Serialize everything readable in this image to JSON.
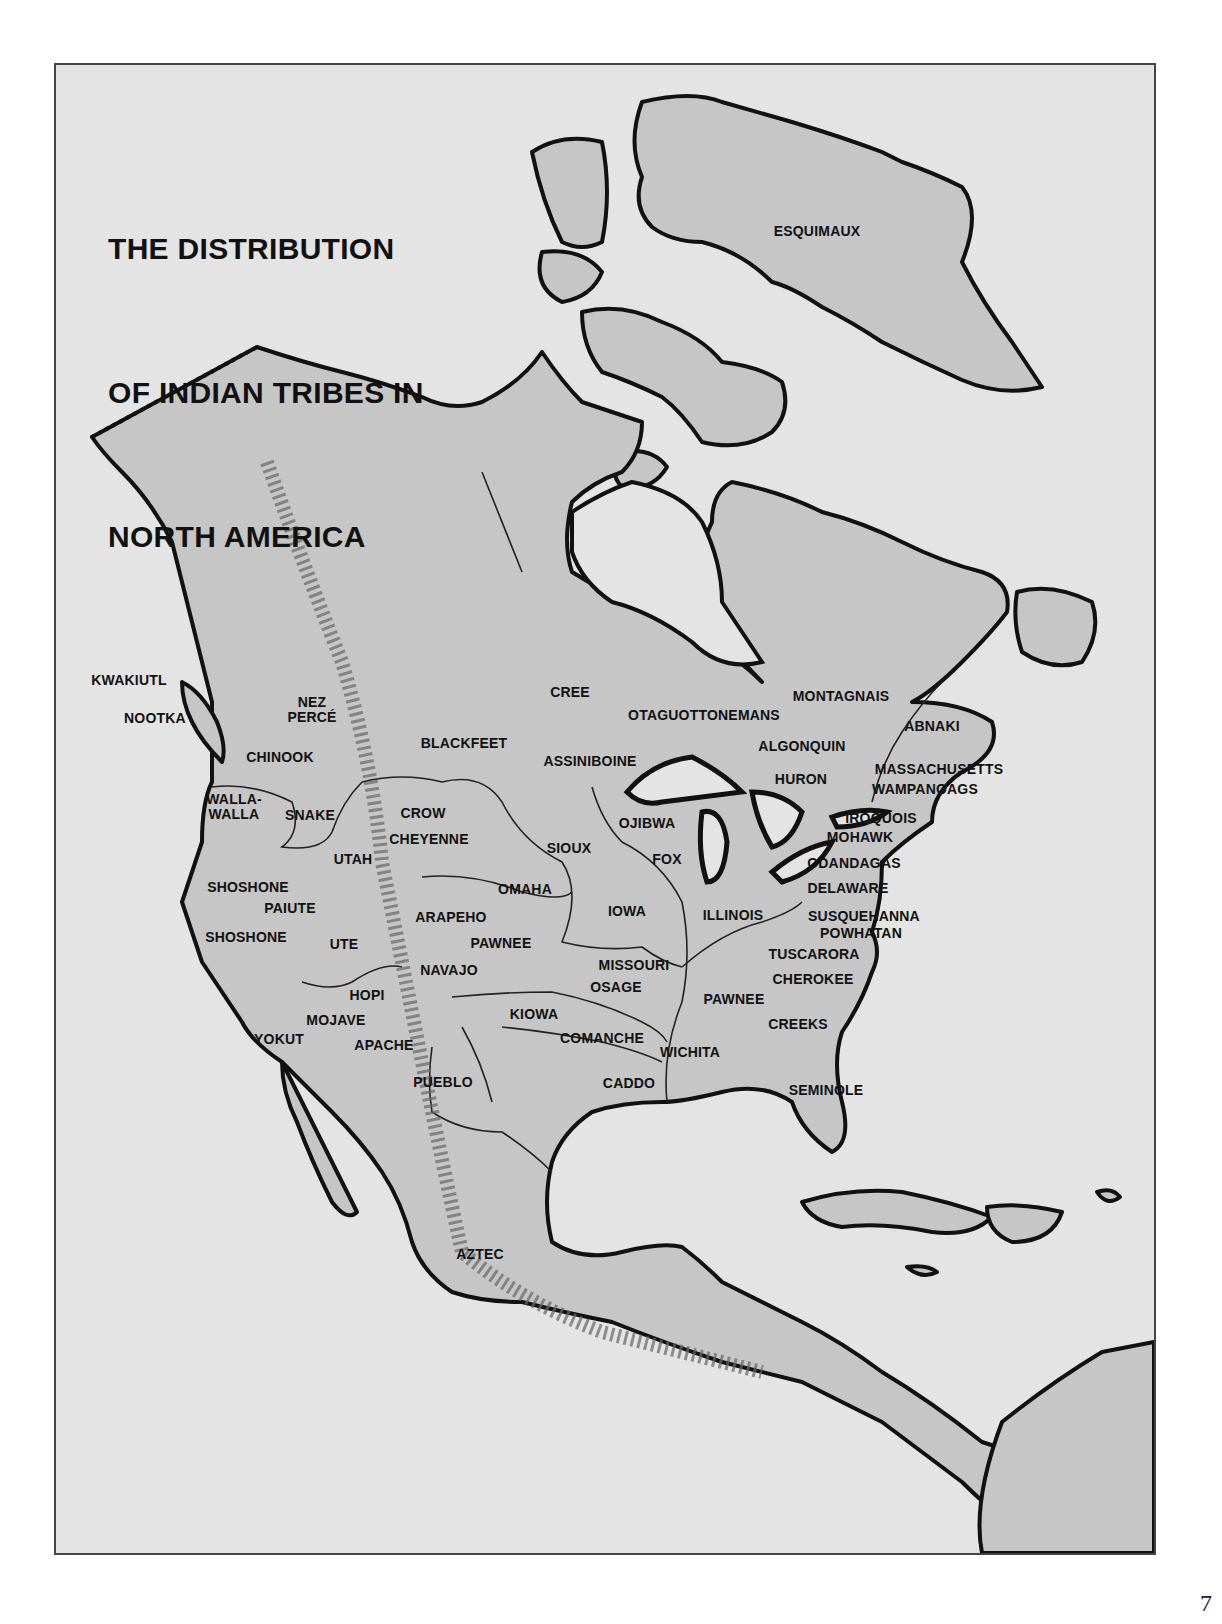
{
  "page": {
    "page_number": "7",
    "background_color": "#ffffff"
  },
  "map": {
    "title_lines": [
      "THE DISTRIBUTION",
      "OF INDIAN TRIBES IN",
      "NORTH AMERICA"
    ],
    "colors": {
      "sea": "#e4e4e4",
      "land": "#c6c6c6",
      "outline": "#111111",
      "rivers": "#222222",
      "mountains": "#555555"
    },
    "labels": [
      {
        "id": "esquimaux",
        "lines": [
          "ESQUIMAUX"
        ],
        "x": 815,
        "y": 229
      },
      {
        "id": "kwakiutl",
        "lines": [
          "KWAKIUTL"
        ],
        "x": 127,
        "y": 678
      },
      {
        "id": "nootka",
        "lines": [
          "NOOTKA"
        ],
        "x": 153,
        "y": 716
      },
      {
        "id": "nez-perce",
        "lines": [
          "NEZ",
          "PERCÉ"
        ],
        "x": 310,
        "y": 700
      },
      {
        "id": "cree",
        "lines": [
          "CREE"
        ],
        "x": 568,
        "y": 690
      },
      {
        "id": "otaguottonemans",
        "lines": [
          "OTAGUOTTONEMANS"
        ],
        "x": 702,
        "y": 713
      },
      {
        "id": "montagnais",
        "lines": [
          "MONTAGNAIS"
        ],
        "x": 839,
        "y": 694
      },
      {
        "id": "abnaki",
        "lines": [
          "ABNAKI"
        ],
        "x": 930,
        "y": 724
      },
      {
        "id": "blackfeet",
        "lines": [
          "BLACKFEET"
        ],
        "x": 462,
        "y": 741
      },
      {
        "id": "chinook",
        "lines": [
          "CHINOOK"
        ],
        "x": 278,
        "y": 755
      },
      {
        "id": "assiniboine",
        "lines": [
          "ASSINIBOINE"
        ],
        "x": 588,
        "y": 759
      },
      {
        "id": "algonquin",
        "lines": [
          "ALGONQUIN"
        ],
        "x": 800,
        "y": 744
      },
      {
        "id": "huron",
        "lines": [
          "HURON"
        ],
        "x": 799,
        "y": 777
      },
      {
        "id": "massachusetts",
        "lines": [
          "MASSACHUSETTS"
        ],
        "x": 937,
        "y": 767
      },
      {
        "id": "wampanoags",
        "lines": [
          "WAMPANOAGS"
        ],
        "x": 923,
        "y": 787
      },
      {
        "id": "walla-walla",
        "lines": [
          "WALLA-",
          "WALLA"
        ],
        "x": 232,
        "y": 797
      },
      {
        "id": "snake",
        "lines": [
          "SNAKE"
        ],
        "x": 308,
        "y": 813
      },
      {
        "id": "crow",
        "lines": [
          "CROW"
        ],
        "x": 421,
        "y": 811
      },
      {
        "id": "cheyenne",
        "lines": [
          "CHEYENNE"
        ],
        "x": 427,
        "y": 837
      },
      {
        "id": "ojibwa",
        "lines": [
          "OJIBWA"
        ],
        "x": 645,
        "y": 821
      },
      {
        "id": "iroquois",
        "lines": [
          "IROQUOIS"
        ],
        "x": 879,
        "y": 816
      },
      {
        "id": "mohawk",
        "lines": [
          "MOHAWK"
        ],
        "x": 858,
        "y": 835
      },
      {
        "id": "sioux",
        "lines": [
          "SIOUX"
        ],
        "x": 567,
        "y": 846
      },
      {
        "id": "fox",
        "lines": [
          "FOX"
        ],
        "x": 665,
        "y": 857
      },
      {
        "id": "utah",
        "lines": [
          "UTAH"
        ],
        "x": 351,
        "y": 857
      },
      {
        "id": "odandagas",
        "lines": [
          "ODANDAGAS"
        ],
        "x": 852,
        "y": 861
      },
      {
        "id": "shoshone-north",
        "lines": [
          "SHOSHONE"
        ],
        "x": 246,
        "y": 885
      },
      {
        "id": "omaha",
        "lines": [
          "OMAHA"
        ],
        "x": 523,
        "y": 887
      },
      {
        "id": "delaware",
        "lines": [
          "DELAWARE"
        ],
        "x": 846,
        "y": 886
      },
      {
        "id": "paiute",
        "lines": [
          "PAIUTE"
        ],
        "x": 288,
        "y": 906
      },
      {
        "id": "arapeho",
        "lines": [
          "ARAPEHO"
        ],
        "x": 449,
        "y": 915
      },
      {
        "id": "iowa",
        "lines": [
          "IOWA"
        ],
        "x": 625,
        "y": 909
      },
      {
        "id": "illinois",
        "lines": [
          "ILLINOIS"
        ],
        "x": 731,
        "y": 913
      },
      {
        "id": "susquehanna",
        "lines": [
          "SUSQUEHANNA"
        ],
        "x": 862,
        "y": 914
      },
      {
        "id": "powhatan",
        "lines": [
          "POWHATAN"
        ],
        "x": 859,
        "y": 931
      },
      {
        "id": "shoshone-south",
        "lines": [
          "SHOSHONE"
        ],
        "x": 244,
        "y": 935
      },
      {
        "id": "ute",
        "lines": [
          "UTE"
        ],
        "x": 342,
        "y": 942
      },
      {
        "id": "pawnee-west",
        "lines": [
          "PAWNEE"
        ],
        "x": 499,
        "y": 941
      },
      {
        "id": "tuscarora",
        "lines": [
          "TUSCARORA"
        ],
        "x": 812,
        "y": 952
      },
      {
        "id": "missouri",
        "lines": [
          "MISSOURI"
        ],
        "x": 632,
        "y": 963
      },
      {
        "id": "navajo",
        "lines": [
          "NAVAJO"
        ],
        "x": 447,
        "y": 968
      },
      {
        "id": "cherokee",
        "lines": [
          "CHEROKEE"
        ],
        "x": 811,
        "y": 977
      },
      {
        "id": "osage",
        "lines": [
          "OSAGE"
        ],
        "x": 614,
        "y": 985
      },
      {
        "id": "hopi",
        "lines": [
          "HOPI"
        ],
        "x": 365,
        "y": 993
      },
      {
        "id": "pawnee-east",
        "lines": [
          "PAWNEE"
        ],
        "x": 732,
        "y": 997
      },
      {
        "id": "kiowa",
        "lines": [
          "KIOWA"
        ],
        "x": 532,
        "y": 1012
      },
      {
        "id": "mojave",
        "lines": [
          "MOJAVE"
        ],
        "x": 334,
        "y": 1018
      },
      {
        "id": "creeks",
        "lines": [
          "CREEKS"
        ],
        "x": 796,
        "y": 1022
      },
      {
        "id": "yokut",
        "lines": [
          "YOKUT"
        ],
        "x": 277,
        "y": 1037
      },
      {
        "id": "comanche",
        "lines": [
          "COMANCHE"
        ],
        "x": 600,
        "y": 1036
      },
      {
        "id": "apache",
        "lines": [
          "APACHE"
        ],
        "x": 382,
        "y": 1043
      },
      {
        "id": "wichita",
        "lines": [
          "WICHITA"
        ],
        "x": 688,
        "y": 1050
      },
      {
        "id": "pueblo",
        "lines": [
          "PUEBLO"
        ],
        "x": 441,
        "y": 1080
      },
      {
        "id": "caddo",
        "lines": [
          "CADDO"
        ],
        "x": 627,
        "y": 1081
      },
      {
        "id": "seminole",
        "lines": [
          "SEMINOLE"
        ],
        "x": 824,
        "y": 1088
      },
      {
        "id": "aztec",
        "lines": [
          "AZTEC"
        ],
        "x": 478,
        "y": 1252
      }
    ]
  }
}
